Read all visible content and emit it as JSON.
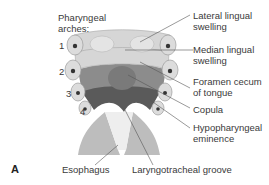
{
  "figure": {
    "panel_label": "A",
    "left_title": "Pharyngeal\narches:",
    "arch_numbers": [
      "1",
      "2",
      "3",
      "4"
    ],
    "labels": {
      "lateral_lingual": "Lateral lingual\nswelling",
      "median_lingual": "Median lingual\nswelling",
      "foramen_cecum": "Foramen cecum\nof tongue",
      "copula": "Copula",
      "hypopharyngeal": "Hypopharyngeal\neminence",
      "esophagus": "Esophagus",
      "laryngotracheal": "Laryngotracheal groove"
    },
    "colors": {
      "arch_tissue": "#d6d6d6",
      "arch_outline": "#a8a8a8",
      "dark_region": "#5a5a5a",
      "mid_region": "#8c8c8c",
      "leader_line": "#555555"
    }
  }
}
